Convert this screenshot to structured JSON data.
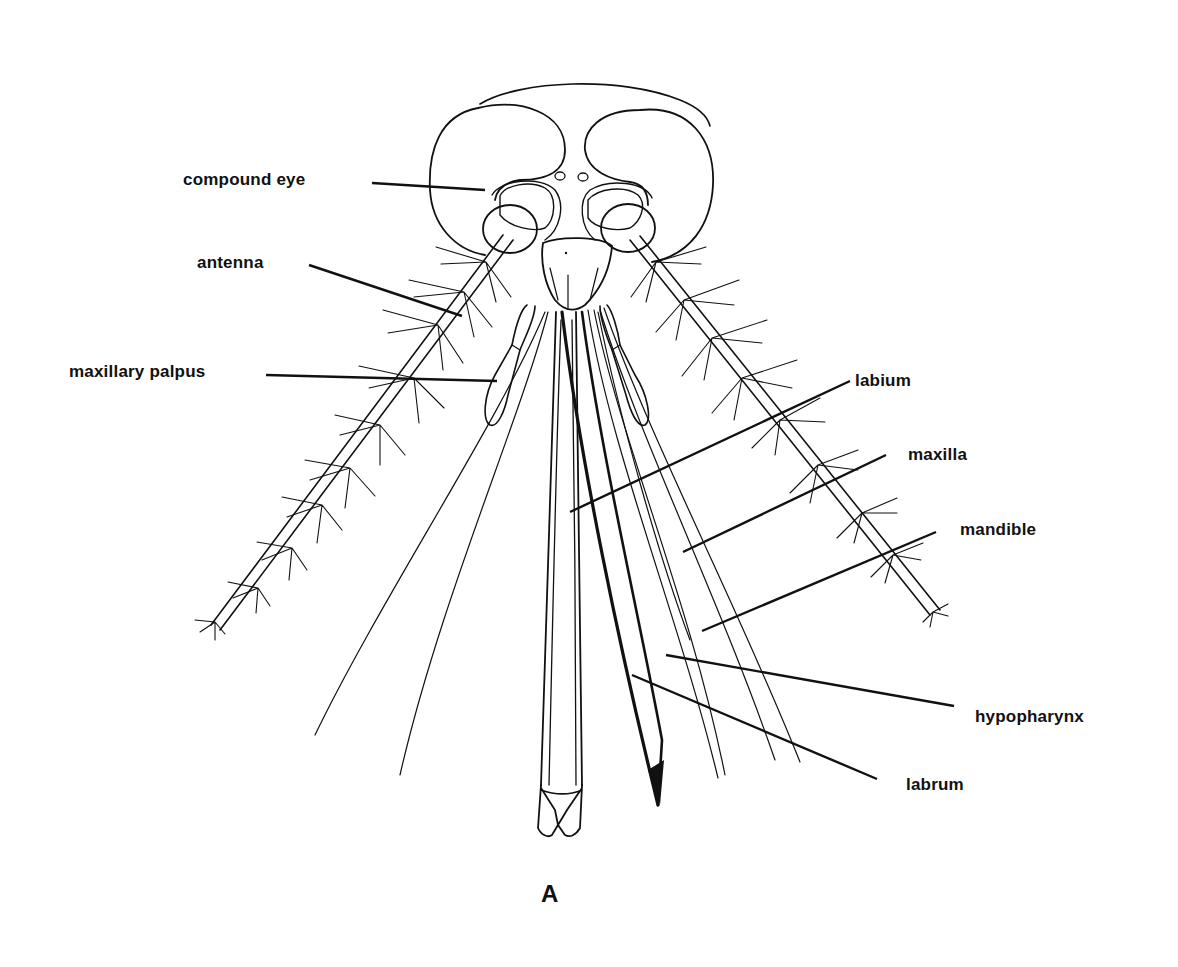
{
  "diagram": {
    "caption": "A",
    "colors": {
      "ink": "#111111",
      "background": "#ffffff"
    },
    "labels": [
      {
        "id": "compound-eye",
        "text": "compound eye",
        "x": 183,
        "y": 170,
        "leader": [
          [
            372,
            183
          ],
          [
            485,
            190
          ]
        ]
      },
      {
        "id": "antenna",
        "text": "antenna",
        "x": 197,
        "y": 253,
        "leader": [
          [
            309,
            265
          ],
          [
            462,
            316
          ]
        ]
      },
      {
        "id": "maxillary-palpus",
        "text": "maxillary palpus",
        "x": 69,
        "y": 362,
        "leader": [
          [
            266,
            375
          ],
          [
            497,
            381
          ]
        ]
      },
      {
        "id": "labium",
        "text": "labium",
        "x": 855,
        "y": 373,
        "leader": [
          [
            850,
            381
          ],
          [
            570,
            512
          ]
        ]
      },
      {
        "id": "maxilla",
        "text": "maxilla",
        "x": 908,
        "y": 447,
        "leader": [
          [
            886,
            455
          ],
          [
            683,
            552
          ]
        ]
      },
      {
        "id": "mandible",
        "text": "mandible",
        "x": 960,
        "y": 522,
        "leader": [
          [
            936,
            532
          ],
          [
            702,
            631
          ]
        ]
      },
      {
        "id": "hypopharynx",
        "text": "hypopharynx",
        "x": 975,
        "y": 707,
        "leader": [
          [
            954,
            706
          ],
          [
            666,
            655
          ]
        ]
      },
      {
        "id": "labrum",
        "text": "labrum",
        "x": 906,
        "y": 776,
        "leader": [
          [
            877,
            779
          ],
          [
            632,
            675
          ]
        ]
      }
    ]
  }
}
